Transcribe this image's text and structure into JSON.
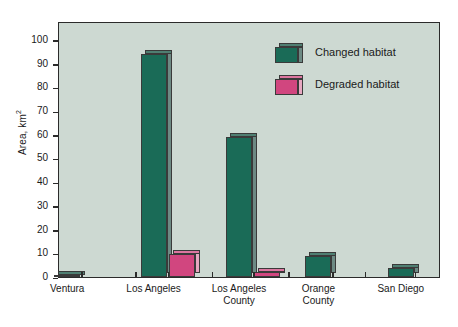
{
  "chart_data": {
    "type": "bar",
    "title": "",
    "subtitle": "",
    "xlabel": "",
    "ylabel": "Area, km²",
    "ylabel_text": "Area, km",
    "ylabel_sup": "2",
    "categories": [
      "Ventura",
      "Los Angeles",
      "Los Angeles\nCounty",
      "Orange\nCounty",
      "San Diego"
    ],
    "series": [
      {
        "name": "Changed habitat",
        "color": "#1a6b57",
        "side_color": "#6d8a84",
        "top_color": "#4f7f72",
        "values": [
          1,
          94,
          59,
          9,
          4
        ]
      },
      {
        "name": "Degraded habitat",
        "color": "#d1467f",
        "side_color": "#e7a8c1",
        "top_color": "#dd76a0",
        "values": [
          0,
          9.5,
          2,
          0,
          0
        ]
      }
    ],
    "ylim": [
      0,
      108
    ],
    "yticks": [
      0,
      10,
      20,
      30,
      40,
      50,
      60,
      70,
      80,
      90,
      100
    ],
    "ytick_labels": [
      "0",
      "10",
      "20",
      "30",
      "40",
      "50",
      "60",
      "70",
      "80",
      "90",
      "100"
    ],
    "grid": false,
    "legend_position": "upper right",
    "plot_background": "#cdd9d2",
    "frame_color": "#2b2b2b",
    "page_background": "#ffffff"
  },
  "legend": {
    "items": [
      {
        "label": "Changed habitat"
      },
      {
        "label": "Degraded habitat"
      }
    ]
  }
}
